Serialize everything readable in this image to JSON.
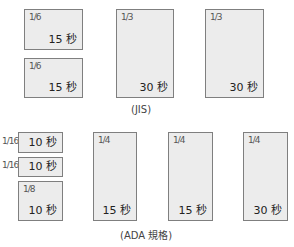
{
  "jis": {
    "caption": "(JIS)",
    "boxes": [
      {
        "fraction": "1/6",
        "duration": "15 秒"
      },
      {
        "fraction": "1/6",
        "duration": "15 秒"
      },
      {
        "fraction": "1/3",
        "duration": "30 秒"
      },
      {
        "fraction": "1/3",
        "duration": "30 秒"
      }
    ]
  },
  "ada": {
    "caption": "(ADA 規格)",
    "boxes": [
      {
        "fraction": "1/16",
        "duration": "10 秒"
      },
      {
        "fraction": "1/16",
        "duration": "10 秒"
      },
      {
        "fraction": "1/8",
        "duration": "10 秒"
      },
      {
        "fraction": "1/4",
        "duration": "15 秒"
      },
      {
        "fraction": "1/4",
        "duration": "15 秒"
      },
      {
        "fraction": "1/4",
        "duration": "30 秒"
      }
    ]
  },
  "colors": {
    "box_fill": "#ececec",
    "box_border": "#7f7f7f"
  }
}
